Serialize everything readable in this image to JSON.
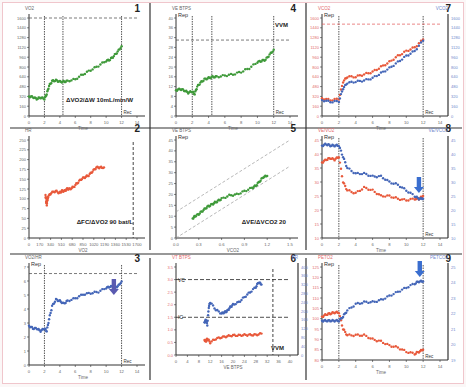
{
  "figure": {
    "colors": {
      "green": "#3f9a3a",
      "red": "#e8593b",
      "blue": "#4466b8",
      "arrow": "#5a5ab0",
      "arrow_blue": "#3a6ecf",
      "axis": "#333333",
      "tick": "#666666",
      "red_tick": "#e36b6b",
      "blue_tick": "#7088cc",
      "grid_dash": "#444444"
    }
  },
  "chart_data": [
    {
      "panel": "1",
      "type": "scatter",
      "ylabel": "VO2",
      "xlabel": "Time",
      "end_label": "Rec",
      "annotation": "ΔVO2/ΔW 10mL/min/W",
      "x_ticks": [
        "0",
        "2",
        "4",
        "6",
        "8",
        "10",
        "12",
        "14"
      ],
      "y_ticks": [
        "0",
        "160",
        "320",
        "480",
        "640",
        "800",
        "960",
        "1120",
        "1280",
        "1440",
        "1600"
      ],
      "xlim": [
        0,
        14
      ],
      "ylim": [
        0,
        1600
      ],
      "vlines": [
        2,
        4.4,
        12
      ],
      "hline": 1600,
      "series": [
        {
          "name": "VO2",
          "color": "green",
          "x": [
            0,
            0.5,
            1,
            1.5,
            2,
            2.3,
            2.6,
            3,
            3.5,
            4,
            4.5,
            5,
            6,
            7,
            8,
            9,
            10,
            10.5,
            11,
            11.5,
            12
          ],
          "y": [
            320,
            310,
            280,
            300,
            280,
            360,
            490,
            570,
            580,
            560,
            560,
            570,
            600,
            680,
            750,
            820,
            900,
            920,
            980,
            1050,
            1140
          ]
        }
      ]
    },
    {
      "panel": "4",
      "type": "scatter",
      "ylabel": "VE BTPS",
      "rep_label": "Rep",
      "xlabel": "Time",
      "end_label": "Rec",
      "annotation": "VVM",
      "x_ticks": [
        "0",
        "2",
        "4",
        "6",
        "8",
        "10",
        "12",
        "14"
      ],
      "y_ticks": [
        "0",
        "4",
        "8",
        "12",
        "16",
        "20",
        "24",
        "28",
        "32",
        "36",
        "40"
      ],
      "xlim": [
        0,
        14
      ],
      "ylim": [
        0,
        40
      ],
      "vlines": [
        2,
        4.4,
        12
      ],
      "hline": 31,
      "series": [
        {
          "name": "VE",
          "color": "green",
          "x": [
            0,
            0.5,
            1,
            1.5,
            2,
            2.3,
            2.6,
            3,
            3.5,
            4,
            4.5,
            5,
            6,
            7,
            8,
            9,
            10,
            10.5,
            11,
            11.5,
            12
          ],
          "y": [
            10.5,
            11,
            10.5,
            9.5,
            10,
            9,
            12,
            13.5,
            15,
            15.5,
            16,
            16,
            16.5,
            17,
            18,
            19.5,
            22,
            22.5,
            23,
            25,
            27
          ]
        }
      ]
    },
    {
      "panel": "7",
      "type": "line",
      "ylabel_left": "VCO2",
      "ylabel_right": "VCO2",
      "rep_label": "Rep",
      "xlabel": "Time",
      "end_label": "Rec",
      "x_ticks": [
        "0",
        "2",
        "4",
        "6",
        "8",
        "10",
        "12",
        "14"
      ],
      "y_ticks_left": [
        "0",
        "160",
        "320",
        "480",
        "640",
        "800",
        "960",
        "1120",
        "1280",
        "1440",
        "1600"
      ],
      "xlim": [
        0,
        14
      ],
      "ylim": [
        0,
        1600
      ],
      "vlines": [
        2,
        12
      ],
      "hline": 1500,
      "series": [
        {
          "name": "VO2",
          "color": "red",
          "x": [
            0,
            1,
            2,
            2.5,
            3,
            4,
            5,
            6,
            7,
            8,
            9,
            10,
            11,
            12
          ],
          "y": [
            290,
            260,
            280,
            560,
            640,
            640,
            680,
            720,
            800,
            880,
            980,
            1060,
            1120,
            1250
          ]
        },
        {
          "name": "VCO2",
          "color": "blue",
          "x": [
            0,
            1,
            2,
            2.5,
            3,
            4,
            5,
            6,
            7,
            8,
            9,
            10,
            11,
            12
          ],
          "y": [
            260,
            230,
            240,
            450,
            540,
            560,
            580,
            620,
            700,
            780,
            880,
            980,
            1060,
            1230
          ]
        }
      ]
    },
    {
      "panel": "2",
      "type": "scatter",
      "ylabel": "HR",
      "xlabel": "VO2",
      "annotation": "ΔFC/ΔVO2 90 bat/L",
      "x_ticks": [
        "0",
        "170",
        "340",
        "510",
        "680",
        "850",
        "1020",
        "1190",
        "1360",
        "1530",
        "1700"
      ],
      "y_ticks": [
        "0",
        "25",
        "50",
        "75",
        "100",
        "125",
        "150",
        "175",
        "200",
        "225",
        "250"
      ],
      "xlim": [
        0,
        1700
      ],
      "ylim": [
        0,
        250
      ],
      "vline": 1640,
      "series": [
        {
          "name": "HR",
          "color": "red",
          "x": [
            260,
            270,
            280,
            290,
            300,
            350,
            420,
            480,
            520,
            560,
            600,
            640,
            700,
            760,
            820,
            880,
            940,
            1000,
            1060,
            1120,
            1180
          ],
          "y": [
            110,
            95,
            85,
            100,
            105,
            115,
            120,
            115,
            120,
            120,
            125,
            125,
            130,
            140,
            150,
            155,
            160,
            170,
            180,
            180,
            180
          ]
        }
      ]
    },
    {
      "panel": "5",
      "type": "scatter",
      "ylabel": "VE BTPS",
      "rep_label": "Rep",
      "xlabel": "VCO2",
      "annotation": "ΔVE/ΔVCO2 20",
      "x_ticks": [
        "0.0",
        "0.3",
        "0.6",
        "0.9",
        "1.2",
        "1.5"
      ],
      "y_ticks": [
        "0",
        "5",
        "10",
        "15",
        "20",
        "25",
        "30",
        "35",
        "40",
        "45"
      ],
      "xlim": [
        0,
        1.5
      ],
      "ylim": [
        0,
        45
      ],
      "series": [
        {
          "name": "VE",
          "color": "green",
          "x": [
            0.22,
            0.25,
            0.3,
            0.35,
            0.4,
            0.45,
            0.5,
            0.55,
            0.6,
            0.7,
            0.8,
            0.9,
            1.0,
            1.05,
            1.1,
            1.15,
            1.2
          ],
          "y": [
            9,
            10,
            11,
            12.5,
            14,
            15,
            16,
            17,
            18,
            19.5,
            20,
            21.5,
            23,
            24,
            26,
            28,
            28.5
          ]
        }
      ]
    },
    {
      "panel": "8",
      "type": "line",
      "ylabel_left": "VE/VO2",
      "ylabel_right": "VE/VCO2",
      "rep_label": "Rep",
      "xlabel": "Time",
      "end_label": "Rec",
      "x_ticks": [
        "0",
        "2",
        "4",
        "6",
        "8",
        "10",
        "12",
        "14"
      ],
      "y_ticks_left": [
        "10",
        "15",
        "20",
        "25",
        "30",
        "35",
        "40",
        "45"
      ],
      "xlim": [
        0,
        14
      ],
      "ylim": [
        10,
        45
      ],
      "vlines": [
        2,
        12
      ],
      "series": [
        {
          "name": "VE/VO2",
          "color": "red",
          "x": [
            0,
            0.5,
            1,
            1.5,
            2,
            2.5,
            3,
            4,
            5,
            6,
            7,
            8,
            9,
            10,
            11,
            11.5,
            12
          ],
          "y": [
            37,
            38,
            38.5,
            38,
            39,
            30,
            27,
            26,
            28,
            27,
            25,
            25,
            24,
            23.5,
            24,
            24,
            25
          ]
        },
        {
          "name": "VE/VCO2",
          "color": "blue",
          "x": [
            0,
            0.5,
            1,
            1.5,
            2,
            2.5,
            3,
            4,
            5,
            6,
            7,
            8,
            9,
            10,
            11,
            11.5,
            12
          ],
          "y": [
            43,
            43.5,
            43,
            43,
            43,
            39,
            35,
            33,
            33,
            32,
            32,
            30,
            29,
            27,
            25,
            24,
            24
          ]
        }
      ],
      "arrow_x": 11.5
    },
    {
      "panel": "3",
      "type": "scatter",
      "ylabel": "VO2/HR",
      "rep_label": "Rep",
      "xlabel": "Time",
      "end_label": "Rec",
      "x_ticks": [
        "0",
        "2",
        "4",
        "6",
        "8",
        "10",
        "12",
        "14"
      ],
      "y_ticks": [
        "0",
        "1",
        "2",
        "3",
        "4",
        "5",
        "6",
        "7"
      ],
      "xlim": [
        0,
        14
      ],
      "ylim": [
        0,
        7.5
      ],
      "vlines": [
        2,
        12
      ],
      "hline": 7,
      "series": [
        {
          "name": "O2 pulse",
          "color": "blue",
          "x": [
            0,
            0.5,
            1,
            1.5,
            2,
            2.3,
            2.6,
            3,
            3.5,
            4,
            4.5,
            5,
            6,
            7,
            8,
            9,
            10,
            10.5,
            11,
            11.5,
            12
          ],
          "y": [
            3,
            2.8,
            2.8,
            2.6,
            2.8,
            2.6,
            3.5,
            4.5,
            5,
            4.9,
            4.7,
            4.9,
            5.1,
            5.4,
            5.5,
            5.6,
            5.9,
            6,
            6,
            6,
            6.4
          ]
        }
      ],
      "arrow_x": 11
    },
    {
      "panel": "6",
      "type": "scatter",
      "ylabel_left": "VT BTPS",
      "ylabel_right": "BR",
      "xlabel": "VE BTPS",
      "annotation": "VVM",
      "x_ticks": [
        "0",
        "4",
        "8",
        "12",
        "16",
        "20",
        "24",
        "28",
        "32",
        "36",
        "40"
      ],
      "y_ticks_left": [
        "0.0",
        "0.5",
        "1.0",
        "1.5",
        "2.0",
        "2.5",
        "3.0",
        "3.5"
      ],
      "y_ticks_right": [
        "0",
        "40",
        "80",
        "120",
        "160",
        "200",
        "240",
        "280",
        "320",
        "360",
        "400"
      ],
      "xlim": [
        0,
        40
      ],
      "ylim": [
        0,
        3.5
      ],
      "hline_labels": [
        {
          "label": "VC",
          "y": 3.0
        },
        {
          "label": "IC",
          "y": 1.5
        }
      ],
      "vline": 34,
      "series": [
        {
          "name": "VT",
          "color": "blue",
          "x": [
            10,
            10.5,
            11,
            11.5,
            12,
            14,
            16,
            17,
            18,
            19,
            20,
            22,
            24,
            26,
            28,
            29,
            30
          ],
          "y": [
            1.3,
            1.4,
            1.2,
            1.9,
            2.1,
            1.8,
            1.65,
            1.7,
            1.75,
            1.9,
            2.0,
            2.1,
            2.3,
            2.5,
            2.7,
            2.9,
            2.8
          ]
        },
        {
          "name": "BR",
          "color": "red",
          "x": [
            10,
            10.5,
            11,
            12,
            14,
            16,
            18,
            20,
            22,
            24,
            26,
            28,
            30
          ],
          "y": [
            0.6,
            0.55,
            0.65,
            0.5,
            0.65,
            0.7,
            0.75,
            0.78,
            0.78,
            0.8,
            0.8,
            0.8,
            0.85
          ]
        }
      ]
    },
    {
      "panel": "9",
      "type": "line",
      "ylabel_left": "PETO2",
      "ylabel_right": "PETCO2",
      "rep_label": "Rep",
      "xlabel": "Time",
      "end_label": "Rec",
      "x_ticks": [
        "0",
        "2",
        "4",
        "6",
        "8",
        "10",
        "12",
        "14"
      ],
      "y_ticks_left": [
        "80",
        "85",
        "90",
        "95",
        "100",
        "105",
        "110",
        "115",
        "120",
        "125"
      ],
      "y_ticks_right": [
        "19",
        "20",
        "21",
        "22",
        "23",
        "24",
        "25"
      ],
      "xlim": [
        0,
        14
      ],
      "ylim": [
        80,
        125
      ],
      "vlines": [
        2,
        12
      ],
      "series": [
        {
          "name": "PETO2",
          "color": "red",
          "x": [
            0,
            0.5,
            1,
            1.5,
            2,
            2.5,
            3,
            4,
            5,
            6,
            7,
            8,
            9,
            10,
            11,
            11.5,
            12
          ],
          "y": [
            101,
            102,
            102.5,
            103,
            103,
            95,
            92,
            92,
            92,
            90,
            89,
            87,
            86,
            84,
            83,
            84,
            85
          ]
        },
        {
          "name": "PETCO2",
          "color": "blue",
          "x": [
            0,
            0.5,
            1,
            1.5,
            2,
            2.5,
            3,
            4,
            5,
            6,
            7,
            8,
            9,
            10,
            11,
            11.5,
            12
          ],
          "y": [
            99,
            99,
            99,
            99,
            99,
            101,
            104,
            107,
            108,
            108,
            109,
            111,
            113,
            115,
            117,
            118,
            118
          ]
        }
      ],
      "arrow_x": 11.6
    }
  ]
}
